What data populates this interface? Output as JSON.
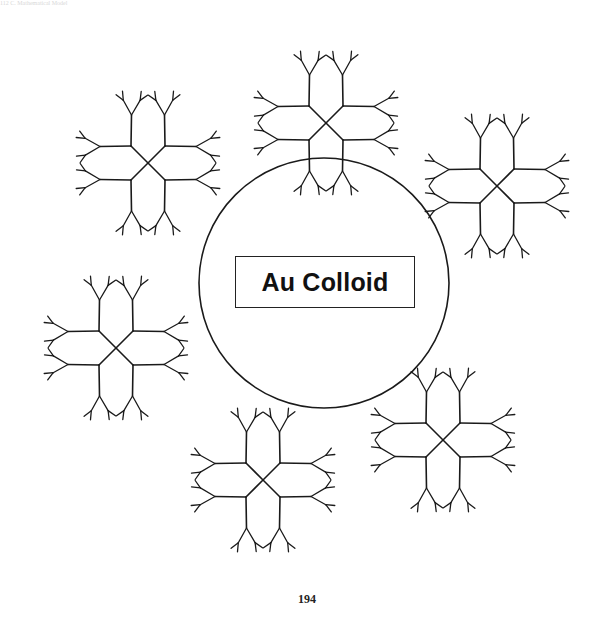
{
  "page": {
    "running_head": "112     C. Mathematical Model",
    "page_number": "194"
  },
  "figure": {
    "core_label": "Au Colloid",
    "stroke_color": "#1a1a1a",
    "core_circle": {
      "cx": 324,
      "cy": 283,
      "r": 125
    },
    "dendrimer_count": 6,
    "dendrimers": [
      {
        "name": "dendrimer-top-left",
        "cx": 148,
        "cy": 163
      },
      {
        "name": "dendrimer-top",
        "cx": 326,
        "cy": 123
      },
      {
        "name": "dendrimer-right",
        "cx": 497,
        "cy": 186
      },
      {
        "name": "dendrimer-left",
        "cx": 116,
        "cy": 348
      },
      {
        "name": "dendrimer-bottom",
        "cx": 263,
        "cy": 480
      },
      {
        "name": "dendrimer-bottom-right",
        "cx": 443,
        "cy": 440
      }
    ],
    "arms_per_dendrimer": 4,
    "generations": 4
  }
}
